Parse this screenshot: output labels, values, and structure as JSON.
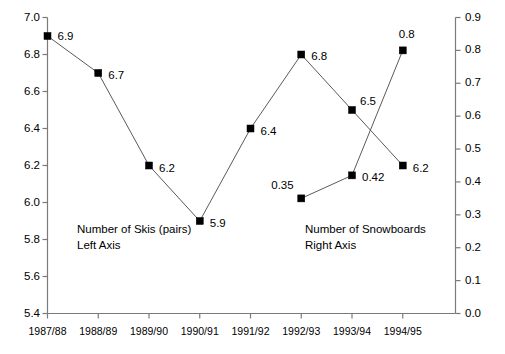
{
  "chart_data": {
    "type": "line",
    "title": "",
    "subtitle": "",
    "xlabel": "",
    "ylabel": "",
    "grid": false,
    "legend_position": "inline-annotation",
    "categories": [
      "1987/88",
      "1988/89",
      "1989/90",
      "1990/91",
      "1991/92",
      "1992/93",
      "1993/94",
      "1994/95"
    ],
    "axes": {
      "left": {
        "label": "Number of Skis (pairs) Left Axis",
        "ylim": [
          5.4,
          7.0
        ],
        "tick_step": 0.2,
        "ticks": [
          "5.4",
          "5.6",
          "5.8",
          "6.0",
          "6.2",
          "6.4",
          "6.6",
          "6.8",
          "7.0"
        ]
      },
      "right": {
        "label": "Number of Snowboards Right Axis",
        "ylim": [
          0.0,
          0.9
        ],
        "tick_step": 0.1,
        "ticks": [
          "0.0",
          "0.1",
          "0.2",
          "0.3",
          "0.4",
          "0.5",
          "0.6",
          "0.7",
          "0.8",
          "0.9"
        ]
      }
    },
    "series": [
      {
        "name": "Number of Skis (pairs)",
        "axis": "left",
        "marker": "filled-square",
        "color": "#000000",
        "x": [
          "1987/88",
          "1988/89",
          "1989/90",
          "1990/91",
          "1991/92",
          "1992/93",
          "1993/94",
          "1994/95"
        ],
        "values": [
          6.9,
          6.7,
          6.2,
          5.9,
          6.4,
          6.8,
          6.5,
          6.2
        ],
        "labels": [
          "6.9",
          "6.7",
          "6.2",
          "5.9",
          "6.4",
          "6.8",
          "6.5",
          "6.2"
        ]
      },
      {
        "name": "Number of Snowboards",
        "axis": "right",
        "marker": "filled-square",
        "color": "#000000",
        "x": [
          "1992/93",
          "1993/94",
          "1994/95"
        ],
        "values": [
          0.35,
          0.42,
          0.8
        ],
        "labels": [
          "0.35",
          "0.42",
          "0.8"
        ]
      }
    ],
    "annotations": [
      {
        "id": "skis-note",
        "line1": "Number of Skis (pairs)",
        "line2": "Left Axis"
      },
      {
        "id": "snowboards-note",
        "line1": "Number of Snowboards",
        "line2": "Right Axis"
      }
    ]
  }
}
